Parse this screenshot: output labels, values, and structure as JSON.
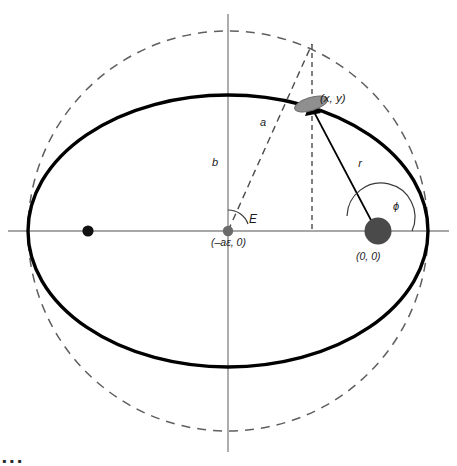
{
  "figure": {
    "type": "orbital-ellipse-diagram",
    "background_color": "#ffffff",
    "ink_color": "#000000",
    "axis_color": "#808080",
    "dashed_color": "#6e6e6e",
    "sun_color": "#4d4d4d",
    "planet_color": "#8c8c8c"
  },
  "labels": {
    "semi_major": "a",
    "semi_minor": "b",
    "radius": "r",
    "eccentric_anomaly": "E",
    "true_anomaly": "ϕ",
    "point_xy": "(x, y)",
    "ellipse_center_coord": "(–aε, 0)",
    "focus_coord": "(0, 0)"
  },
  "caption": {
    "cropped_text": "▪ ▪ ▪"
  },
  "geometry": {
    "origin_x": 228,
    "origin_y": 231,
    "semi_major_px": 200,
    "semi_minor_px": 136,
    "circle_radius_px": 200,
    "focus_right": {
      "x": 378,
      "y": 231
    },
    "focus_left": {
      "x": 88,
      "y": 231
    },
    "planet": {
      "x": 311,
      "y": 104
    },
    "circle_point": {
      "x": 312,
      "y": 44
    },
    "axis_x_start": 8,
    "axis_x_end": 449,
    "axis_y_start": 14,
    "axis_y_end": 452
  }
}
